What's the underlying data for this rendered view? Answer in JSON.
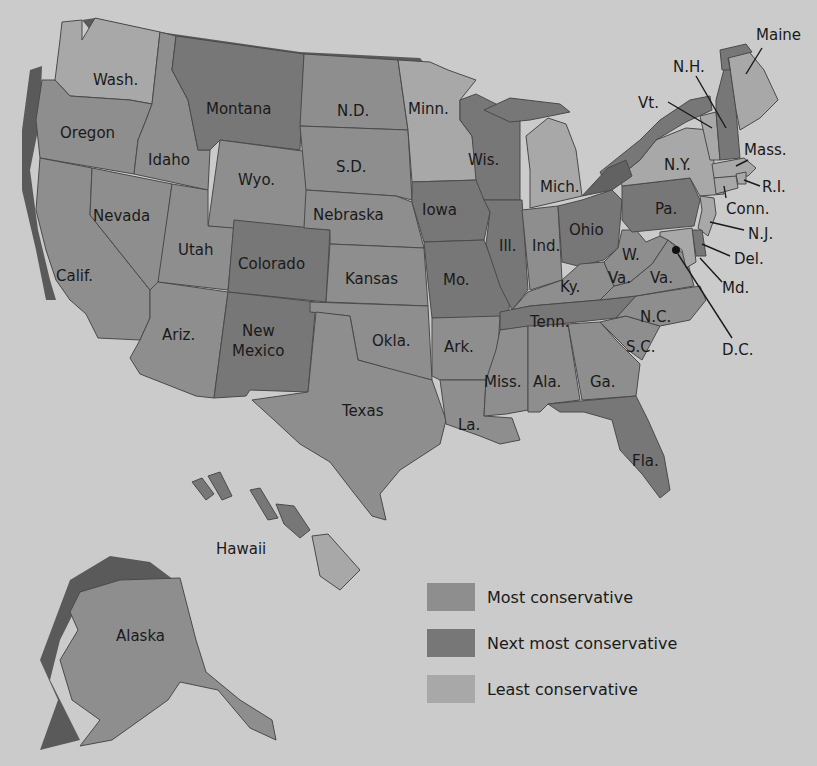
{
  "map": {
    "categories": {
      "most": {
        "label": "Most conservative",
        "color": "#8e8e8e"
      },
      "next": {
        "label": "Next most conservative",
        "color": "#777777"
      },
      "least": {
        "label": "Least conservative",
        "color": "#a8a8a8"
      }
    },
    "background_color": "#cbcbcb",
    "states": [
      {
        "name": "Wash.",
        "category": "least"
      },
      {
        "name": "Oregon",
        "category": "most"
      },
      {
        "name": "Calif.",
        "category": "most"
      },
      {
        "name": "Idaho",
        "category": "most"
      },
      {
        "name": "Nevada",
        "category": "most"
      },
      {
        "name": "Montana",
        "category": "next"
      },
      {
        "name": "Wyo.",
        "category": "most"
      },
      {
        "name": "Utah",
        "category": "most"
      },
      {
        "name": "Colorado",
        "category": "next"
      },
      {
        "name": "Ariz.",
        "category": "most"
      },
      {
        "name": "New Mexico",
        "category": "next"
      },
      {
        "name": "N.D.",
        "category": "most"
      },
      {
        "name": "S.D.",
        "category": "most"
      },
      {
        "name": "Nebraska",
        "category": "most"
      },
      {
        "name": "Kansas",
        "category": "most"
      },
      {
        "name": "Okla.",
        "category": "most"
      },
      {
        "name": "Texas",
        "category": "most"
      },
      {
        "name": "Minn.",
        "category": "least"
      },
      {
        "name": "Iowa",
        "category": "next"
      },
      {
        "name": "Mo.",
        "category": "next"
      },
      {
        "name": "Ark.",
        "category": "most"
      },
      {
        "name": "La.",
        "category": "most"
      },
      {
        "name": "Wis.",
        "category": "next"
      },
      {
        "name": "Ill.",
        "category": "next"
      },
      {
        "name": "Mich.",
        "category": "least"
      },
      {
        "name": "Ind.",
        "category": "most"
      },
      {
        "name": "Ohio",
        "category": "next"
      },
      {
        "name": "Ky.",
        "category": "most"
      },
      {
        "name": "Tenn.",
        "category": "next"
      },
      {
        "name": "Miss.",
        "category": "most"
      },
      {
        "name": "Ala.",
        "category": "most"
      },
      {
        "name": "Ga.",
        "category": "most"
      },
      {
        "name": "Fla.",
        "category": "next"
      },
      {
        "name": "S.C.",
        "category": "most"
      },
      {
        "name": "N.C.",
        "category": "most"
      },
      {
        "name": "Va.",
        "category": "most"
      },
      {
        "name": "W. Va.",
        "category": "most"
      },
      {
        "name": "Pa.",
        "category": "next"
      },
      {
        "name": "N.Y.",
        "category": "least"
      },
      {
        "name": "Vt.",
        "category": "least"
      },
      {
        "name": "N.H.",
        "category": "next"
      },
      {
        "name": "Maine",
        "category": "least"
      },
      {
        "name": "Mass.",
        "category": "least"
      },
      {
        "name": "R.I.",
        "category": "least"
      },
      {
        "name": "Conn.",
        "category": "least"
      },
      {
        "name": "N.J.",
        "category": "least"
      },
      {
        "name": "Del.",
        "category": "next"
      },
      {
        "name": "Md.",
        "category": "least"
      },
      {
        "name": "D.C.",
        "category": "least"
      },
      {
        "name": "Alaska",
        "category": "most"
      },
      {
        "name": "Hawaii",
        "category": "least"
      }
    ],
    "labels": {
      "wash": "Wash.",
      "oregon": "Oregon",
      "calif": "Calif.",
      "idaho": "Idaho",
      "nevada": "Nevada",
      "montana": "Montana",
      "wyo": "Wyo.",
      "utah": "Utah",
      "colorado": "Colorado",
      "ariz": "Ariz.",
      "newmexico1": "New",
      "newmexico2": "Mexico",
      "nd": "N.D.",
      "sd": "S.D.",
      "nebraska": "Nebraska",
      "kansas": "Kansas",
      "okla": "Okla.",
      "texas": "Texas",
      "minn": "Minn.",
      "iowa": "Iowa",
      "mo": "Mo.",
      "ark": "Ark.",
      "la": "La.",
      "wis": "Wis.",
      "ill": "Ill.",
      "mich": "Mich.",
      "ind": "Ind.",
      "ohio": "Ohio",
      "ky": "Ky.",
      "tenn": "Tenn.",
      "miss": "Miss.",
      "ala": "Ala.",
      "ga": "Ga.",
      "fla": "Fla.",
      "sc": "S.C.",
      "nc": "N.C.",
      "va": "Va.",
      "wva1": "W.",
      "wva2": "Va.",
      "pa": "Pa.",
      "ny": "N.Y.",
      "vt": "Vt.",
      "nh": "N.H.",
      "maine": "Maine",
      "mass": "Mass.",
      "ri": "R.I.",
      "conn": "Conn.",
      "nj": "N.J.",
      "del": "Del.",
      "md": "Md.",
      "dc": "D.C.",
      "alaska": "Alaska",
      "hawaii": "Hawaii"
    }
  },
  "legend": [
    {
      "label": "Most conservative",
      "color": "#8e8e8e"
    },
    {
      "label": "Next most conservative",
      "color": "#777777"
    },
    {
      "label": "Least conservative",
      "color": "#a8a8a8"
    }
  ]
}
